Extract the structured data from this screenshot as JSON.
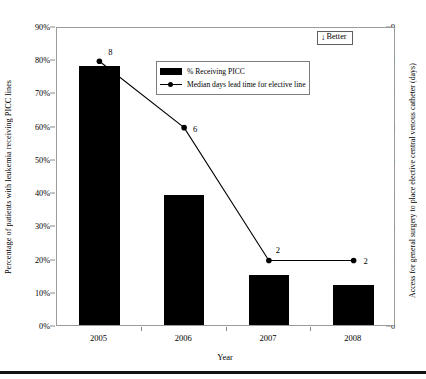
{
  "chart_data": {
    "type": "bar",
    "title": "",
    "categories": [
      "2005",
      "2006",
      "2007",
      "2008"
    ],
    "xlabel": "Year",
    "ylabel": "Percentage of patients with leukemia receiving PICC lines",
    "y2label": "Access for general surgery to place elective central venous catheter (days)",
    "ylim": [
      0,
      90
    ],
    "y2lim": [
      0,
      9
    ],
    "grid": false,
    "legend_position": "top-center",
    "series": [
      {
        "name": "% Receiving PICC",
        "type": "bar",
        "axis": "left",
        "color": "#000000",
        "values": [
          78,
          39,
          15,
          12
        ]
      },
      {
        "name": "Median days lead time for elective line",
        "type": "line",
        "axis": "right",
        "color": "#000000",
        "values": [
          8,
          6,
          2,
          2
        ],
        "point_labels": [
          "8",
          "6",
          "2",
          "2"
        ]
      }
    ],
    "ytick_labels": [
      "0%",
      "10%",
      "20%",
      "30%",
      "40%",
      "50%",
      "60%",
      "70%",
      "80%",
      "90%"
    ],
    "ytick_values": [
      0,
      10,
      20,
      30,
      40,
      50,
      60,
      70,
      80,
      90
    ],
    "y2tick_labels": [
      "0",
      "1",
      "2",
      "3",
      "4",
      "5",
      "6",
      "7",
      "8",
      "9"
    ],
    "y2tick_values": [
      0,
      1,
      2,
      3,
      4,
      5,
      6,
      7,
      8,
      9
    ],
    "annotations": [
      {
        "name": "better-badge",
        "text": "Better",
        "icon": "down-arrow-icon",
        "glyph": "↓"
      }
    ]
  }
}
